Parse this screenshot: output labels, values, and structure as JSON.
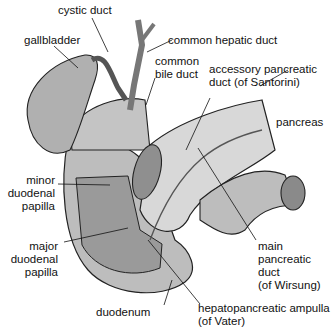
{
  "diagram": {
    "labels": {
      "cystic_duct": "cystic duct",
      "gallbladder": "gallbladder",
      "common_hepatic_duct": "common hepatic duct",
      "common_bile_duct_1": "common",
      "common_bile_duct_2": "bile duct",
      "accessory_1": "accessory pancreatic",
      "accessory_2": "duct (of Santorini)",
      "pancreas": "pancreas",
      "minor_1": "minor",
      "minor_2": "duodenal",
      "minor_3": "papilla",
      "major_1": "major",
      "major_2": "duodenal",
      "major_3": "papilla",
      "main_1": "main",
      "main_2": "pancreatic",
      "main_3": "duct",
      "main_4": "(of Wirsung)",
      "duodenum": "duodenum",
      "ampulla_1": "hepatopancreatic ampulla",
      "ampulla_2": "(of Vater)"
    },
    "colors": {
      "organ": "#b8b8b8",
      "organ_light": "#d6d6d6",
      "outline": "#222222",
      "text": "#111111"
    }
  }
}
